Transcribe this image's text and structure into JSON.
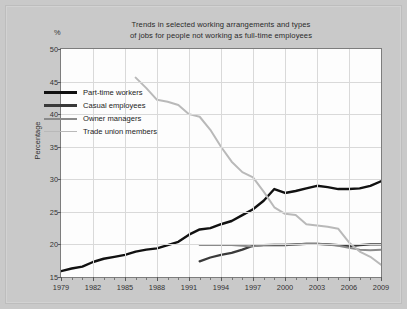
{
  "figure": {
    "title_line1": "Trends in selected working arrangements and types",
    "title_line2": "of jobs for people not working as full-time employees",
    "percent_symbol": "%",
    "ylabel": "Percentage"
  },
  "colors": {
    "background": "#c9c9c9",
    "plot_background": "#fdfdfd",
    "gridline": "#d9d9d9",
    "axis": "#7d7d7d",
    "part_time_workers": "#111111",
    "casual_employees": "#3a3a3a",
    "owner_managers": "#8a8a8a",
    "trade_union_members": "#b9b9b9"
  },
  "chart_data": {
    "type": "line",
    "title": "Trends in selected working arrangements and types of jobs for people not working as full-time employees",
    "xlabel": "",
    "ylabel": "Percentage",
    "xlim": [
      1979,
      2009
    ],
    "ylim": [
      15,
      50
    ],
    "ytick_values": [
      15,
      20,
      25,
      30,
      35,
      40,
      45,
      50
    ],
    "ytick_labels": [
      "15",
      "20",
      "25",
      "30",
      "35",
      "40",
      "45",
      "50"
    ],
    "xtick_values": [
      1979,
      1982,
      1985,
      1988,
      1991,
      1994,
      1997,
      2000,
      2003,
      2006,
      2009
    ],
    "xtick_labels": [
      "1979",
      "1982",
      "1985",
      "1988",
      "1991",
      "1994",
      "1997",
      "2000",
      "2003",
      "2006",
      "2009"
    ],
    "xtick_minor_step": 1,
    "grid": true,
    "legend_position": "upper-left-inside",
    "series": [
      {
        "name": "Part-time workers",
        "color": "#111111",
        "width": 2.4,
        "x": [
          1979,
          1980,
          1981,
          1982,
          1983,
          1984,
          1985,
          1986,
          1987,
          1988,
          1989,
          1990,
          1991,
          1992,
          1993,
          1994,
          1995,
          1996,
          1997,
          1998,
          1999,
          2000,
          2001,
          2002,
          2003,
          2004,
          2005,
          2006,
          2007,
          2008,
          2009
        ],
        "y": [
          15.9,
          16.3,
          16.6,
          17.3,
          17.8,
          18.1,
          18.4,
          18.9,
          19.2,
          19.4,
          19.9,
          20.4,
          21.5,
          22.3,
          22.5,
          23.1,
          23.6,
          24.5,
          25.4,
          26.7,
          28.5,
          27.9,
          28.2,
          28.6,
          29.0,
          28.8,
          28.5,
          28.5,
          28.6,
          29.0,
          29.7
        ]
      },
      {
        "name": "Casual employees",
        "color": "#3a3a3a",
        "width": 2.2,
        "x": [
          1992,
          1993,
          1994,
          1995,
          1996,
          1997,
          1998,
          1999,
          2000,
          2001,
          2002,
          2003,
          2004,
          2005,
          2006,
          2007,
          2008,
          2009
        ],
        "y": [
          17.4,
          18.0,
          18.4,
          18.7,
          19.2,
          19.8,
          19.9,
          19.9,
          19.9,
          20.0,
          20.1,
          20.1,
          20.0,
          19.9,
          19.7,
          19.9,
          20.0,
          20.0
        ]
      },
      {
        "name": "Owner managers",
        "color": "#8a8a8a",
        "width": 2.0,
        "x": [
          1992,
          1993,
          1994,
          1995,
          1996,
          1997,
          1998,
          1999,
          2000,
          2001,
          2002,
          2003,
          2004,
          2005,
          2006,
          2007,
          2008,
          2009
        ],
        "y": [
          19.9,
          19.9,
          19.9,
          19.9,
          19.8,
          19.7,
          19.9,
          20.0,
          20.0,
          20.0,
          20.1,
          20.1,
          20.0,
          19.8,
          19.5,
          19.2,
          19.1,
          19.2
        ]
      },
      {
        "name": "Trade union members",
        "color": "#b9b9b9",
        "width": 2.0,
        "x": [
          1986,
          1987,
          1988,
          1989,
          1990,
          1991,
          1992,
          1993,
          1994,
          1995,
          1996,
          1997,
          1998,
          1999,
          2000,
          2001,
          2002,
          2003,
          2004,
          2005,
          2006,
          2007,
          2008,
          2009
        ],
        "y": [
          45.6,
          44.0,
          42.2,
          41.9,
          41.4,
          40.0,
          39.6,
          37.6,
          35.0,
          32.7,
          31.1,
          30.3,
          28.1,
          25.7,
          24.7,
          24.5,
          23.1,
          22.9,
          22.7,
          22.4,
          20.3,
          18.9,
          18.1,
          16.9
        ]
      }
    ]
  },
  "legend": {
    "items": [
      {
        "label": "Part-time workers",
        "color": "#111111",
        "width": 3.0
      },
      {
        "label": "Casual employees",
        "color": "#3a3a3a",
        "width": 2.6
      },
      {
        "label": "Owner managers",
        "color": "#8a8a8a",
        "width": 2.0
      },
      {
        "label": "Trade union members",
        "color": "#b9b9b9",
        "width": 1.8
      }
    ]
  }
}
